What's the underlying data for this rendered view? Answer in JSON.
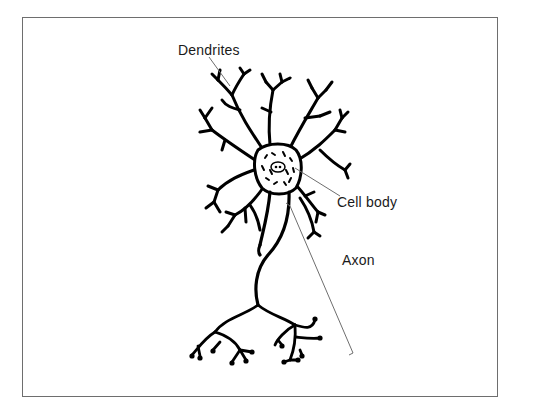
{
  "diagram": {
    "labels": {
      "dendrites": "Dendrites",
      "cell_body": "Cell body",
      "axon": "Axon"
    },
    "colors": {
      "background": "#ffffff",
      "stroke": "#000000",
      "leader_line": "#6e6e6e",
      "frame": "#6e6e6e"
    }
  }
}
